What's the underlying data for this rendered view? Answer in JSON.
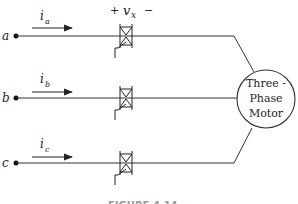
{
  "diagram": {
    "phases": [
      {
        "terminal": "a",
        "current": "i",
        "current_sub": "a"
      },
      {
        "terminal": "b",
        "current": "i",
        "current_sub": "b"
      },
      {
        "terminal": "c",
        "current": "i",
        "current_sub": "c"
      }
    ],
    "voltage": {
      "plus": "+",
      "symbol": "v",
      "sub": "x",
      "minus": "−"
    },
    "motor": {
      "line1": "Three -",
      "line2": "Phase",
      "line3": "Motor"
    },
    "caption": "FIGURE 4.14"
  }
}
